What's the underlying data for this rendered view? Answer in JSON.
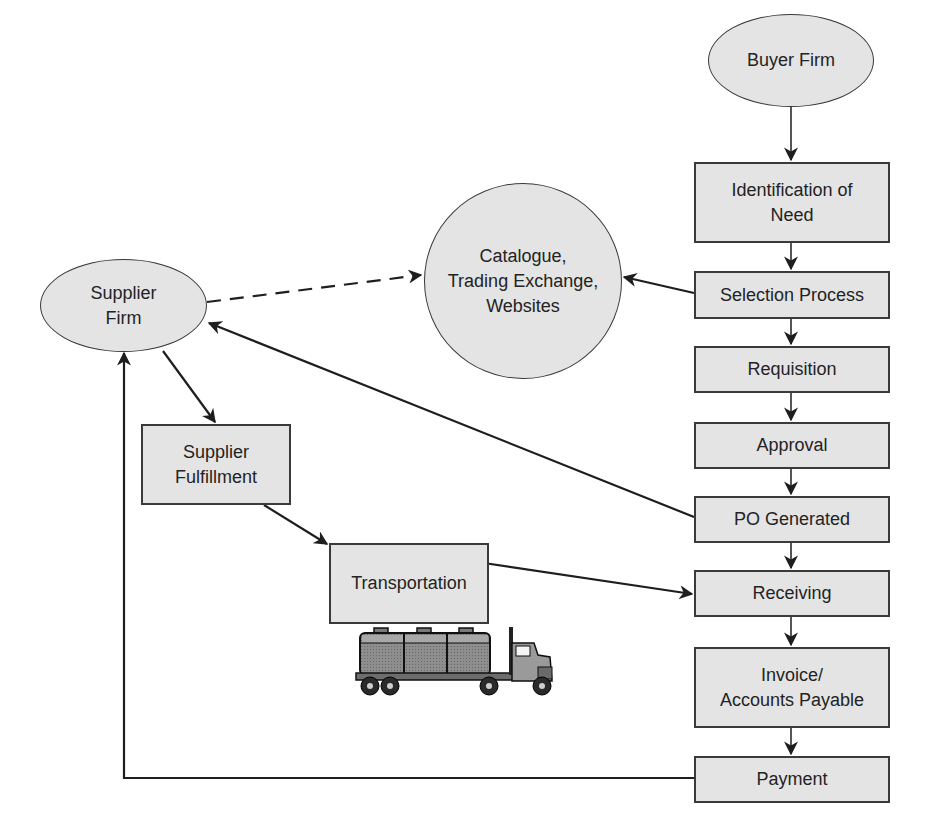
{
  "diagram": {
    "colors": {
      "node_fill": "#e4e4e4",
      "node_border": "#3a3a3a",
      "arrow": "#1e1e1e",
      "background": "#ffffff"
    },
    "nodes": {
      "buyer_firm": "Buyer Firm",
      "identification_of_need": "Identification of\nNeed",
      "selection_process": "Selection Process",
      "requisition": "Requisition",
      "approval": "Approval",
      "po_generated": "PO Generated",
      "receiving": "Receiving",
      "invoice_accounts_payable": "Invoice/\nAccounts Payable",
      "payment": "Payment",
      "catalogue": "Catalogue,\nTrading Exchange,\nWebsites",
      "supplier_firm": "Supplier\nFirm",
      "supplier_fulfillment": "Supplier\nFulfillment",
      "transportation": "Transportation"
    },
    "edges": [
      {
        "from": "Buyer Firm",
        "to": "Identification of Need",
        "style": "solid"
      },
      {
        "from": "Identification of Need",
        "to": "Selection Process",
        "style": "solid"
      },
      {
        "from": "Selection Process",
        "to": "Requisition",
        "style": "solid"
      },
      {
        "from": "Requisition",
        "to": "Approval",
        "style": "solid"
      },
      {
        "from": "Approval",
        "to": "PO Generated",
        "style": "solid"
      },
      {
        "from": "PO Generated",
        "to": "Receiving",
        "style": "solid"
      },
      {
        "from": "Receiving",
        "to": "Invoice/Accounts Payable",
        "style": "solid"
      },
      {
        "from": "Invoice/Accounts Payable",
        "to": "Payment",
        "style": "solid"
      },
      {
        "from": "Selection Process",
        "to": "Catalogue, Trading Exchange, Websites",
        "style": "solid"
      },
      {
        "from": "Supplier Firm",
        "to": "Catalogue, Trading Exchange, Websites",
        "style": "dashed"
      },
      {
        "from": "PO Generated",
        "to": "Supplier Firm",
        "style": "solid"
      },
      {
        "from": "Supplier Firm",
        "to": "Supplier Fulfillment",
        "style": "solid"
      },
      {
        "from": "Supplier Fulfillment",
        "to": "Transportation",
        "style": "solid"
      },
      {
        "from": "Transportation",
        "to": "Receiving",
        "style": "solid"
      },
      {
        "from": "Payment",
        "to": "Supplier Firm",
        "style": "solid"
      }
    ],
    "illustration": "tanker-truck-icon"
  }
}
